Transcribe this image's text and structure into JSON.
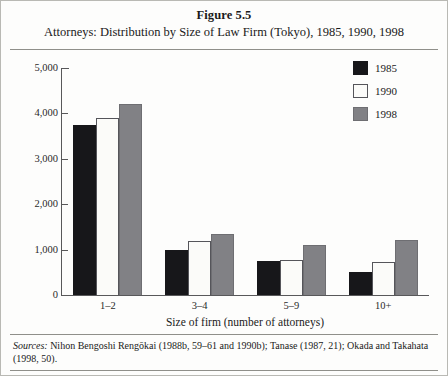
{
  "figure": {
    "number_label": "Figure 5.5",
    "caption": "Attorneys: Distribution by Size of Law Firm (Tokyo), 1985, 1990, 1998"
  },
  "source": {
    "label": "Sources:",
    "text": " Nihon Bengoshi Rengōkai (1988b, 59–61 and 1990b); Tanase (1987, 21); Okada and Takahata (1998, 50)."
  },
  "colors": {
    "series_1985": "#17171a",
    "series_1990": "#fbfbf9",
    "series_1998": "#818185",
    "axis": "#58585a",
    "rule": "#8f8f8a"
  },
  "chart_data": {
    "type": "bar",
    "title": "Attorneys: Distribution by Size of Law Firm (Tokyo), 1985, 1990, 1998",
    "xlabel": "Size of firm (number of attorneys)",
    "ylabel": "",
    "categories": [
      "1–2",
      "3–4",
      "5–9",
      "10+"
    ],
    "ylim": [
      0,
      5000
    ],
    "ytick_labels": [
      "5,000",
      "4,000",
      "3,000",
      "2,000",
      "1,000",
      "0"
    ],
    "ytick_values": [
      5000,
      4000,
      3000,
      2000,
      1000,
      0
    ],
    "grid": false,
    "legend_position": "top-right",
    "series": [
      {
        "name": "1985",
        "color": "#17171a",
        "values": [
          3750,
          1000,
          750,
          500
        ]
      },
      {
        "name": "1990",
        "color": "#fbfbf9",
        "values": [
          3900,
          1200,
          760,
          720
        ]
      },
      {
        "name": "1998",
        "color": "#818185",
        "values": [
          4200,
          1350,
          1100,
          1220
        ]
      }
    ]
  }
}
